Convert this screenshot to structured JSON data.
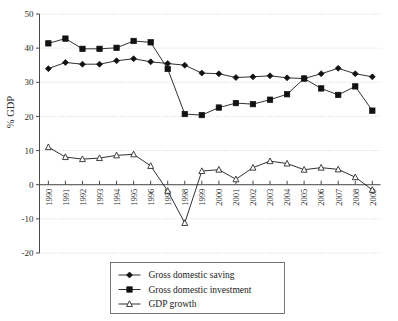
{
  "chart_data": {
    "type": "line",
    "title": "",
    "xlabel": "",
    "ylabel": "% GDP",
    "ylim": [
      -20,
      50
    ],
    "ytick_values": [
      -20,
      -10,
      0,
      10,
      20,
      30,
      40,
      50
    ],
    "ytick_labels": [
      "-20",
      "-10",
      "0",
      "10",
      "20",
      "30",
      "40",
      "50"
    ],
    "grid": true,
    "grid_axis": "y",
    "legend_position": "bottom-center",
    "categories": [
      "1990",
      "1991",
      "1992",
      "1993",
      "1994",
      "1995",
      "1996",
      "1997",
      "1998",
      "1999",
      "2000",
      "2001",
      "2002",
      "2003",
      "2004",
      "2005",
      "2006",
      "2007",
      "2008",
      "2009"
    ],
    "x": [
      1990,
      1991,
      1992,
      1993,
      1994,
      1995,
      1996,
      1997,
      1998,
      1999,
      2000,
      2001,
      2002,
      2003,
      2004,
      2005,
      2006,
      2007,
      2008,
      2009
    ],
    "series": [
      {
        "name": "Gross domestic saving",
        "marker": "filled-diamond",
        "values": [
          34.0,
          35.8,
          35.3,
          35.3,
          36.3,
          36.9,
          36.0,
          35.5,
          35.0,
          32.7,
          32.5,
          31.4,
          31.6,
          31.9,
          31.3,
          31.1,
          32.5,
          34.1,
          32.5,
          31.6
        ]
      },
      {
        "name": "Gross domestic investment",
        "marker": "filled-square",
        "values": [
          41.4,
          42.8,
          39.8,
          39.8,
          40.1,
          42.1,
          41.7,
          33.9,
          20.7,
          20.4,
          22.6,
          23.9,
          23.6,
          24.9,
          26.5,
          31.1,
          28.2,
          26.3,
          28.8,
          21.7
        ]
      },
      {
        "name": "GDP growth",
        "marker": "open-triangle",
        "values": [
          11.0,
          8.1,
          7.5,
          7.8,
          8.6,
          8.9,
          5.5,
          -1.8,
          -11.2,
          4.0,
          4.4,
          1.6,
          5.0,
          6.9,
          6.2,
          4.4,
          5.0,
          4.5,
          2.2,
          -1.5
        ]
      }
    ]
  },
  "axes": {
    "ylabel": "% GDP"
  },
  "legend": {
    "items": [
      {
        "label": "Gross domestic saving",
        "marker": "filled-diamond"
      },
      {
        "label": "Gross domestic investment",
        "marker": "filled-square"
      },
      {
        "label": "GDP growth",
        "marker": "open-triangle"
      }
    ]
  }
}
